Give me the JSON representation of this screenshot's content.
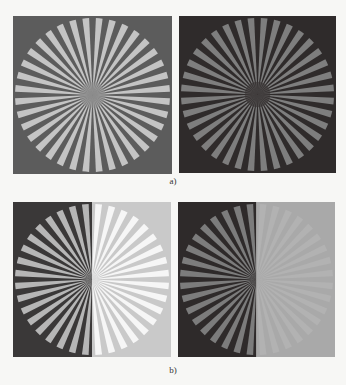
{
  "figure": {
    "rows": [
      {
        "caption": "a)",
        "panels": [
          {
            "name": "siemens-star-gray-bg",
            "bg": "#5c5c5c",
            "bar": "#c4c4c4",
            "center": "#8e8e8e"
          },
          {
            "name": "siemens-star-dark-bg",
            "bg": "#2f2b2b",
            "bar": "#7e7e7e",
            "center": "#3c3838"
          }
        ]
      },
      {
        "caption": "b)",
        "panels": [
          {
            "name": "siemens-star-split-bright",
            "bg_left": "#3a3838",
            "bar_left": "#b6b6b6",
            "bg_right": "#c9c9c9",
            "bar_right": "#f6f6f6"
          },
          {
            "name": "siemens-star-split-flat",
            "bg_left": "#2e2a2a",
            "bar_left": "#7c7c7c",
            "bg_right": "#a9a9a9",
            "bar_right": "#b2b2b2"
          }
        ]
      }
    ],
    "spokes": 36
  }
}
